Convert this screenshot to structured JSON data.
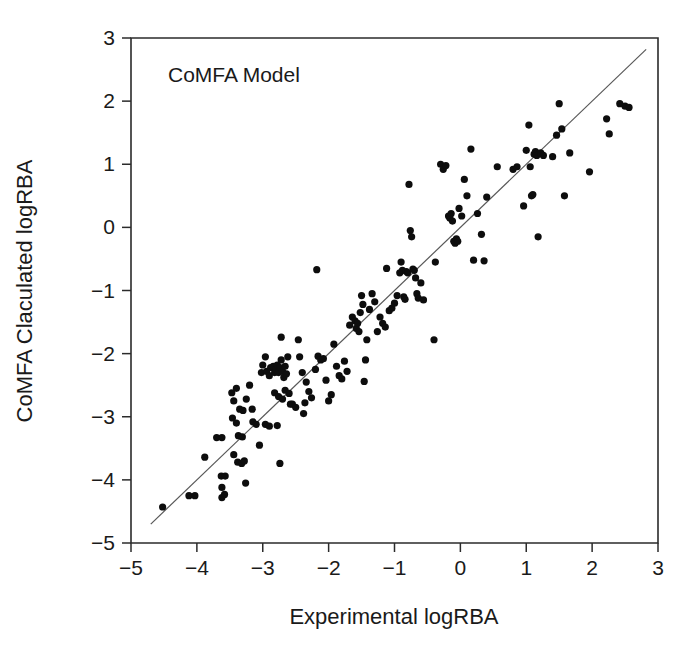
{
  "figure": {
    "background_color": "#ffffff",
    "width": 689,
    "height": 646
  },
  "chart_data": {
    "type": "scatter",
    "title": "",
    "annotation": "CoMFA Model",
    "xlabel": "Experimental logRBA",
    "ylabel": "CoMFA Claculated logRBA",
    "xlim": [
      -5,
      3
    ],
    "ylim": [
      -5,
      3
    ],
    "xticks": [
      -5,
      -4,
      -3,
      -2,
      -1,
      0,
      1,
      2,
      3
    ],
    "xtick_labels": [
      "−5",
      "−4",
      "−3",
      "−2",
      "−1",
      "0",
      "1",
      "2",
      "3"
    ],
    "yticks": [
      -5,
      -4,
      -3,
      -2,
      -1,
      0,
      1,
      2,
      3
    ],
    "ytick_labels": [
      "−5",
      "−4",
      "−3",
      "−2",
      "−1",
      "0",
      "1",
      "2",
      "3"
    ],
    "grid": false,
    "legend": null,
    "marker": {
      "shape": "circle",
      "color": "#0d0d0d",
      "size_px": 7.2
    },
    "reference_line": {
      "kind": "identity",
      "slope": 1,
      "intercept": 0,
      "color": "#585858",
      "x_start": -4.7,
      "x_end": 2.82,
      "y_start": -4.7,
      "y_end": 2.82
    },
    "point_count": 158,
    "points": [
      [
        -4.52,
        -4.43
      ],
      [
        -4.12,
        -4.25
      ],
      [
        -4.03,
        -4.25
      ],
      [
        -3.88,
        -3.64
      ],
      [
        -3.7,
        -3.33
      ],
      [
        -3.62,
        -3.33
      ],
      [
        -3.63,
        -3.94
      ],
      [
        -3.57,
        -3.94
      ],
      [
        -3.62,
        -4.12
      ],
      [
        -3.62,
        -4.28
      ],
      [
        -3.58,
        -4.23
      ],
      [
        -3.47,
        -2.62
      ],
      [
        -3.44,
        -2.75
      ],
      [
        -3.4,
        -2.55
      ],
      [
        -3.46,
        -3.02
      ],
      [
        -3.4,
        -3.1
      ],
      [
        -3.35,
        -2.88
      ],
      [
        -3.3,
        -2.9
      ],
      [
        -3.37,
        -3.3
      ],
      [
        -3.31,
        -3.32
      ],
      [
        -3.44,
        -3.6
      ],
      [
        -3.38,
        -3.72
      ],
      [
        -3.32,
        -3.74
      ],
      [
        -3.28,
        -3.7
      ],
      [
        -3.26,
        -4.05
      ],
      [
        -3.25,
        -2.72
      ],
      [
        -3.2,
        -2.5
      ],
      [
        -3.16,
        -2.88
      ],
      [
        -3.15,
        -3.08
      ],
      [
        -3.1,
        -3.12
      ],
      [
        -3.05,
        -3.45
      ],
      [
        -3.02,
        -2.3
      ],
      [
        -3.0,
        -2.18
      ],
      [
        -2.96,
        -2.05
      ],
      [
        -2.94,
        -2.28
      ],
      [
        -2.9,
        -2.35
      ],
      [
        -2.88,
        -2.22
      ],
      [
        -2.84,
        -2.2
      ],
      [
        -2.82,
        -2.3
      ],
      [
        -2.8,
        -2.25
      ],
      [
        -2.78,
        -2.18
      ],
      [
        -2.76,
        -2.3
      ],
      [
        -2.74,
        -2.22
      ],
      [
        -2.72,
        -2.1
      ],
      [
        -2.7,
        -2.28
      ],
      [
        -2.68,
        -2.38
      ],
      [
        -2.66,
        -2.2
      ],
      [
        -2.64,
        -2.32
      ],
      [
        -2.62,
        -2.05
      ],
      [
        -2.96,
        -3.12
      ],
      [
        -2.9,
        -3.15
      ],
      [
        -2.78,
        -3.14
      ],
      [
        -2.82,
        -2.62
      ],
      [
        -2.76,
        -2.68
      ],
      [
        -2.7,
        -2.72
      ],
      [
        -2.66,
        -2.58
      ],
      [
        -2.6,
        -2.63
      ],
      [
        -2.58,
        -2.8
      ],
      [
        -2.72,
        -1.74
      ],
      [
        -2.55,
        -2.8
      ],
      [
        -2.5,
        -2.85
      ],
      [
        -2.46,
        -1.78
      ],
      [
        -2.44,
        -2.05
      ],
      [
        -2.4,
        -2.3
      ],
      [
        -2.38,
        -2.95
      ],
      [
        -2.36,
        -2.78
      ],
      [
        -2.34,
        -2.45
      ],
      [
        -2.3,
        -2.6
      ],
      [
        -2.26,
        -2.7
      ],
      [
        -2.2,
        -2.25
      ],
      [
        -2.74,
        -3.74
      ],
      [
        -2.18,
        -0.67
      ],
      [
        -2.16,
        -2.04
      ],
      [
        -2.12,
        -2.1
      ],
      [
        -2.08,
        -2.08
      ],
      [
        -2.04,
        -2.42
      ],
      [
        -2.0,
        -2.75
      ],
      [
        -1.96,
        -2.65
      ],
      [
        -1.92,
        -1.85
      ],
      [
        -1.88,
        -2.2
      ],
      [
        -1.84,
        -2.35
      ],
      [
        -1.8,
        -2.4
      ],
      [
        -1.76,
        -2.12
      ],
      [
        -1.72,
        -2.28
      ],
      [
        -1.68,
        -1.55
      ],
      [
        -1.64,
        -1.42
      ],
      [
        -1.6,
        -1.48
      ],
      [
        -1.58,
        -1.6
      ],
      [
        -1.56,
        -1.52
      ],
      [
        -1.54,
        -1.65
      ],
      [
        -1.52,
        -1.35
      ],
      [
        -1.5,
        -1.08
      ],
      [
        -1.48,
        -1.22
      ],
      [
        -1.46,
        -2.44
      ],
      [
        -1.44,
        -2.1
      ],
      [
        -1.42,
        -1.78
      ],
      [
        -1.38,
        -1.3
      ],
      [
        -1.34,
        -1.05
      ],
      [
        -1.3,
        -1.18
      ],
      [
        -1.26,
        -1.65
      ],
      [
        -1.22,
        -1.42
      ],
      [
        -1.18,
        -1.52
      ],
      [
        -1.14,
        -1.58
      ],
      [
        -1.12,
        -0.65
      ],
      [
        -1.08,
        -1.32
      ],
      [
        -1.04,
        -1.28
      ],
      [
        -1.0,
        -1.2
      ],
      [
        -0.96,
        -1.08
      ],
      [
        -0.92,
        -0.72
      ],
      [
        -0.9,
        -0.55
      ],
      [
        -0.88,
        -0.68
      ],
      [
        -0.86,
        -1.1
      ],
      [
        -0.84,
        -1.14
      ],
      [
        -0.82,
        -0.7
      ],
      [
        -0.8,
        -0.72
      ],
      [
        -0.78,
        0.68
      ],
      [
        -0.76,
        -0.05
      ],
      [
        -0.74,
        -0.15
      ],
      [
        -0.72,
        -0.66
      ],
      [
        -0.7,
        -0.68
      ],
      [
        -0.68,
        -0.8
      ],
      [
        -0.66,
        -1.05
      ],
      [
        -0.64,
        -1.12
      ],
      [
        -0.6,
        -0.88
      ],
      [
        -0.56,
        -1.15
      ],
      [
        -0.4,
        -1.78
      ],
      [
        -0.38,
        -0.55
      ],
      [
        -0.3,
        1.0
      ],
      [
        -0.26,
        0.92
      ],
      [
        -0.22,
        0.98
      ],
      [
        -0.18,
        0.18
      ],
      [
        -0.16,
        0.15
      ],
      [
        -0.14,
        0.22
      ],
      [
        -0.12,
        0.1
      ],
      [
        -0.1,
        -0.22
      ],
      [
        -0.08,
        -0.25
      ],
      [
        -0.06,
        -0.18
      ],
      [
        -0.04,
        -0.22
      ],
      [
        -0.02,
        0.3
      ],
      [
        0.02,
        0.18
      ],
      [
        0.06,
        0.76
      ],
      [
        0.1,
        0.5
      ],
      [
        0.16,
        1.24
      ],
      [
        0.2,
        -0.52
      ],
      [
        0.26,
        0.22
      ],
      [
        0.32,
        -0.11
      ],
      [
        0.36,
        -0.53
      ],
      [
        0.4,
        0.48
      ],
      [
        0.56,
        0.96
      ],
      [
        0.8,
        0.92
      ],
      [
        0.86,
        0.96
      ],
      [
        0.96,
        0.34
      ],
      [
        1.0,
        1.22
      ],
      [
        1.04,
        1.62
      ],
      [
        1.06,
        0.96
      ],
      [
        1.08,
        0.5
      ],
      [
        1.1,
        0.52
      ],
      [
        1.12,
        1.16
      ],
      [
        1.14,
        1.2
      ],
      [
        1.16,
        1.14
      ],
      [
        1.18,
        -0.15
      ],
      [
        1.22,
        1.18
      ],
      [
        1.26,
        1.14
      ],
      [
        1.4,
        1.12
      ],
      [
        1.46,
        1.46
      ],
      [
        1.5,
        1.96
      ],
      [
        1.54,
        1.56
      ],
      [
        1.58,
        0.5
      ],
      [
        1.66,
        1.18
      ],
      [
        1.96,
        0.88
      ],
      [
        2.22,
        1.72
      ],
      [
        2.26,
        1.48
      ],
      [
        2.42,
        1.96
      ],
      [
        2.5,
        1.92
      ],
      [
        2.56,
        1.9
      ]
    ]
  }
}
